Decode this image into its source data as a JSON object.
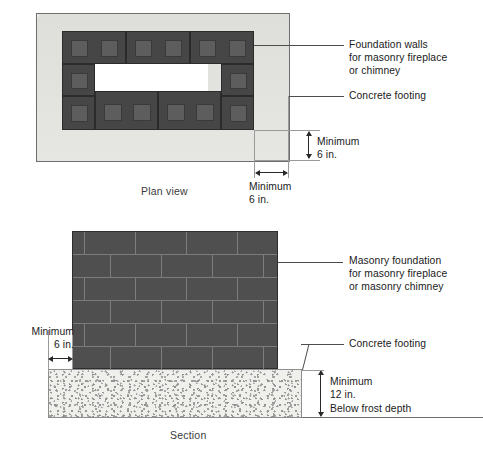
{
  "figure": {
    "title_plan": "Plan view",
    "title_section": "Section"
  },
  "plan": {
    "callouts": [
      {
        "name": "foundation-walls",
        "text": "Foundation walls\nfor masonry fireplace\nor chimney"
      },
      {
        "name": "concrete-footing",
        "text": "Concrete footing"
      }
    ],
    "dimensions": [
      {
        "name": "footing-projection-vertical",
        "text": "Minimum\n6 in.",
        "value": "6 in.",
        "qualifier": "Minimum"
      },
      {
        "name": "footing-projection-horizontal",
        "text": "Minimum\n6 in.",
        "value": "6 in.",
        "qualifier": "Minimum"
      }
    ]
  },
  "section": {
    "callouts": [
      {
        "name": "masonry-foundation",
        "text": "Masonry foundation\nfor masonry fireplace\nor masonry chimney"
      },
      {
        "name": "concrete-footing",
        "text": "Concrete footing"
      }
    ],
    "dimensions": [
      {
        "name": "footing-projection",
        "text": "Minimum\n6 in.",
        "value": "6 in.",
        "qualifier": "Minimum"
      },
      {
        "name": "footing-thickness",
        "text": "Minimum\n12 in.",
        "value": "12 in.",
        "qualifier": "Minimum"
      }
    ],
    "notes": [
      {
        "name": "frost-depth-note",
        "text": "Below frost depth"
      }
    ]
  },
  "colors": {
    "block_fill": "#464646",
    "block_cell": "#5d5d5d",
    "wall_fill": "#4f4f4f",
    "mortar": "#7c7c7c",
    "footing_fill": "#e4e4e2",
    "concrete_fill": "#efefec",
    "void_fill": "#ffffff",
    "leader_line": "#4c4c4c",
    "text": "#1a1a1a"
  }
}
